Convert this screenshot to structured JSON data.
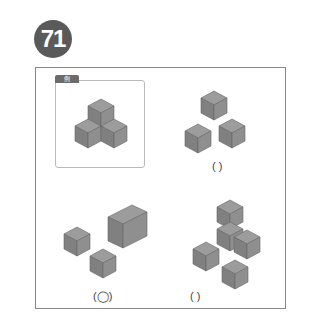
{
  "question": {
    "number": "71",
    "badge_color": "#5a5a5a"
  },
  "example": {
    "tag_label": "例",
    "figure": "three-cube-cluster (one on top, two below)"
  },
  "options": [
    {
      "id": "a",
      "figure": "three separate cubes",
      "answer_mark": "(   )"
    },
    {
      "id": "b",
      "figure": "two cubes and one rectangular prism",
      "answer_mark": "(◯)"
    },
    {
      "id": "c",
      "figure": "L-shaped stack of three cubes plus two separate cubes",
      "answer_mark": "(   )"
    }
  ],
  "colors": {
    "cube_top": "#9a9a9a",
    "cube_left": "#7f7f7f",
    "cube_right": "#8e8e8e",
    "frame": "#888888"
  }
}
